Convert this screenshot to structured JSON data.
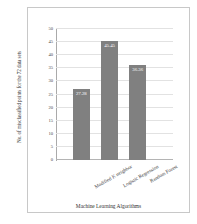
{
  "chart_data": {
    "type": "bar",
    "title": "",
    "categories": [
      "Modified K neighbor",
      "Logistic Regression",
      "Random Forest"
    ],
    "values": [
      27.28,
      45.45,
      36.36
    ],
    "value_labels": [
      "27.28",
      "45.45",
      "36.36"
    ],
    "xlabel": "Machine Learning Algorithms",
    "ylabel": "No. of misclassified points for the 72 data sets",
    "ylim": [
      0,
      50
    ],
    "yticks": [
      0,
      5,
      10,
      15,
      20,
      25,
      30,
      35,
      40,
      45,
      50
    ],
    "ytick_labels": [
      "0",
      "5",
      "10",
      "15",
      "20",
      "25",
      "30",
      "35",
      "40",
      "45",
      "50"
    ],
    "grid": true,
    "legend": false,
    "bar_color": "#808080",
    "gridline_color": "#e2e2e2",
    "label_text_color": "#ffffff"
  }
}
